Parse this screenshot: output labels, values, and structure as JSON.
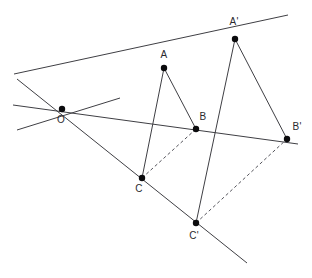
{
  "figure": {
    "width": 312,
    "height": 278,
    "background_color": "#ffffff",
    "line_color": "#3f3f44",
    "dashed_color": "#55555c",
    "point_color": "#0b0b0d",
    "label_color": "#2a2a2e"
  },
  "points": [
    {
      "id": "O",
      "label": "O",
      "x": 62,
      "y": 109,
      "label_x": 61,
      "label_y": 123,
      "anchor": "middle"
    },
    {
      "id": "A",
      "label": "A",
      "x": 164,
      "y": 68,
      "label_x": 164,
      "label_y": 58,
      "anchor": "middle"
    },
    {
      "id": "B",
      "label": "B",
      "x": 196,
      "y": 129,
      "label_x": 203,
      "label_y": 120,
      "anchor": "middle"
    },
    {
      "id": "C",
      "label": "C",
      "x": 142,
      "y": 178,
      "label_x": 139,
      "label_y": 192,
      "anchor": "middle"
    },
    {
      "id": "Ap",
      "label": "A'",
      "x": 235,
      "y": 39,
      "label_x": 234,
      "label_y": 25,
      "anchor": "middle"
    },
    {
      "id": "Bp",
      "label": "B'",
      "x": 287,
      "y": 139,
      "label_x": 297,
      "label_y": 130,
      "anchor": "middle"
    },
    {
      "id": "Cp",
      "label": "C'",
      "x": 196,
      "y": 223,
      "label_x": 194,
      "label_y": 239,
      "anchor": "middle"
    }
  ],
  "rays": [
    {
      "id": "ray-OAAp",
      "name": "ray-through-O-A-Aprime",
      "x1": 14,
      "y1": 74,
      "x2": 288,
      "y2": 15,
      "style": "solid"
    },
    {
      "id": "ray-OBBp",
      "name": "ray-through-O-B-Bprime",
      "x1": 13,
      "y1": 105,
      "x2": 298,
      "y2": 144,
      "style": "solid"
    },
    {
      "id": "ray-OCCp",
      "name": "ray-through-O-C-Cprime",
      "x1": 17,
      "y1": 79,
      "x2": 247,
      "y2": 263,
      "style": "solid"
    },
    {
      "id": "ray-extra",
      "name": "ray-lower-left-through-O",
      "x1": 17,
      "y1": 130,
      "x2": 120,
      "y2": 98,
      "style": "solid"
    }
  ],
  "edges": [
    {
      "id": "edge-AB",
      "name": "triangle-edge-A-B",
      "from": "A",
      "to": "B",
      "style": "solid"
    },
    {
      "id": "edge-AC",
      "name": "triangle-edge-A-C",
      "from": "A",
      "to": "C",
      "style": "solid"
    },
    {
      "id": "edge-CB",
      "name": "triangle-edge-C-B",
      "from": "C",
      "to": "B",
      "style": "dashed"
    },
    {
      "id": "edge-ApBp",
      "name": "triangle-edge-Aprime-Bprime",
      "from": "Ap",
      "to": "Bp",
      "style": "solid"
    },
    {
      "id": "edge-ApCp",
      "name": "triangle-edge-Aprime-Cprime",
      "from": "Ap",
      "to": "Cp",
      "style": "solid"
    },
    {
      "id": "edge-CpBp",
      "name": "triangle-edge-Cprime-Bprime",
      "from": "Cp",
      "to": "Bp",
      "style": "dashed"
    }
  ],
  "labels": {
    "O": "O",
    "A": "A",
    "B": "B",
    "C": "C",
    "Ap": "A'",
    "Bp": "B'",
    "Cp": "C'"
  }
}
